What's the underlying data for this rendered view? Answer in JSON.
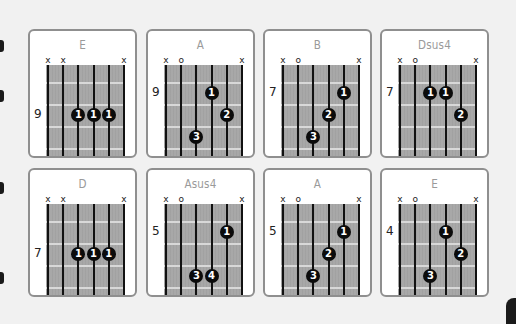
{
  "chords": [
    {
      "name": "E",
      "fret": "9",
      "fret_slot": 2,
      "markers": [
        "x",
        "x",
        "",
        "",
        "",
        "x"
      ],
      "dots": [
        {
          "string": 3,
          "slot": 2,
          "finger": "1"
        },
        {
          "string": 4,
          "slot": 2,
          "finger": "1"
        },
        {
          "string": 5,
          "slot": 2,
          "finger": "1"
        }
      ]
    },
    {
      "name": "A",
      "fret": "9",
      "fret_slot": 1,
      "markers": [
        "x",
        "o",
        "",
        "",
        "",
        "x"
      ],
      "dots": [
        {
          "string": 4,
          "slot": 1,
          "finger": "1"
        },
        {
          "string": 5,
          "slot": 2,
          "finger": "2"
        },
        {
          "string": 3,
          "slot": 3,
          "finger": "3"
        }
      ]
    },
    {
      "name": "B",
      "fret": "7",
      "fret_slot": 1,
      "markers": [
        "x",
        "o",
        "",
        "",
        "",
        "x"
      ],
      "dots": [
        {
          "string": 5,
          "slot": 1,
          "finger": "1"
        },
        {
          "string": 4,
          "slot": 2,
          "finger": "2"
        },
        {
          "string": 3,
          "slot": 3,
          "finger": "3"
        }
      ]
    },
    {
      "name": "Dsus4",
      "fret": "7",
      "fret_slot": 1,
      "markers": [
        "x",
        "o",
        "",
        "",
        "",
        "x"
      ],
      "dots": [
        {
          "string": 3,
          "slot": 1,
          "finger": "1"
        },
        {
          "string": 4,
          "slot": 1,
          "finger": "1"
        },
        {
          "string": 5,
          "slot": 2,
          "finger": "2"
        }
      ]
    },
    {
      "name": "D",
      "fret": "7",
      "fret_slot": 2,
      "markers": [
        "x",
        "x",
        "",
        "",
        "",
        "x"
      ],
      "dots": [
        {
          "string": 3,
          "slot": 2,
          "finger": "1"
        },
        {
          "string": 4,
          "slot": 2,
          "finger": "1"
        },
        {
          "string": 5,
          "slot": 2,
          "finger": "1"
        }
      ]
    },
    {
      "name": "Asus4",
      "fret": "5",
      "fret_slot": 1,
      "markers": [
        "x",
        "o",
        "",
        "",
        "",
        "x"
      ],
      "dots": [
        {
          "string": 5,
          "slot": 1,
          "finger": "1"
        },
        {
          "string": 3,
          "slot": 3,
          "finger": "3"
        },
        {
          "string": 4,
          "slot": 3,
          "finger": "4"
        }
      ]
    },
    {
      "name": "A",
      "fret": "5",
      "fret_slot": 1,
      "markers": [
        "x",
        "o",
        "",
        "",
        "",
        "x"
      ],
      "dots": [
        {
          "string": 5,
          "slot": 1,
          "finger": "1"
        },
        {
          "string": 4,
          "slot": 2,
          "finger": "2"
        },
        {
          "string": 3,
          "slot": 3,
          "finger": "3"
        }
      ]
    },
    {
      "name": "E",
      "fret": "4",
      "fret_slot": 1,
      "markers": [
        "x",
        "o",
        "",
        "",
        "",
        "x"
      ],
      "dots": [
        {
          "string": 4,
          "slot": 1,
          "finger": "1"
        },
        {
          "string": 5,
          "slot": 2,
          "finger": "2"
        },
        {
          "string": 3,
          "slot": 3,
          "finger": "3"
        }
      ]
    }
  ],
  "colors": {
    "card_border": "#8f8f8f",
    "fretboard": "#a8a8a8",
    "fret_line": "#d8d8d8",
    "string": "#111111",
    "dot": "#0b0b0b",
    "title": "#9a9a9a"
  }
}
